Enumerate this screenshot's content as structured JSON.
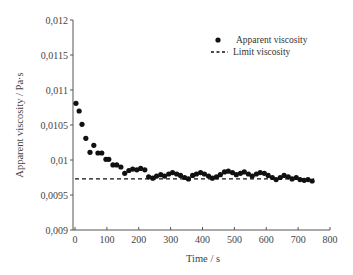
{
  "chart_data": {
    "type": "scatter",
    "title": "",
    "xlabel": "Time / s",
    "ylabel": "Apparent viscosity / Pa·s",
    "xlim": [
      0,
      800
    ],
    "ylim": [
      0.009,
      0.012
    ],
    "xticks": [
      0,
      100,
      200,
      300,
      400,
      500,
      600,
      700,
      800
    ],
    "xtick_labels": [
      "0",
      "100",
      "200",
      "300",
      "400",
      "500",
      "600",
      "700",
      "800"
    ],
    "yticks": [
      0.009,
      0.0095,
      0.01,
      0.0105,
      0.011,
      0.0115,
      0.012
    ],
    "ytick_labels": [
      "0,009",
      "0,0095",
      "0,01",
      "0,0105",
      "0,011",
      "0,0115",
      "0,012"
    ],
    "grid": false,
    "legend_position": "upper right",
    "series": [
      {
        "name": "Apparent viscosity",
        "style": "markers",
        "marker": "filled-circle",
        "color": "#111111",
        "x": [
          3,
          13,
          22,
          34,
          47,
          59,
          72,
          84,
          97,
          106,
          119,
          131,
          144,
          156,
          169,
          181,
          194,
          206,
          219,
          231,
          244,
          256,
          269,
          281,
          294,
          306,
          319,
          331,
          344,
          356,
          369,
          381,
          394,
          406,
          419,
          431,
          444,
          456,
          469,
          481,
          494,
          506,
          519,
          531,
          544,
          556,
          569,
          581,
          594,
          606,
          619,
          631,
          644,
          656,
          669,
          681,
          694,
          706,
          719,
          731,
          744
        ],
        "y": [
          0.01081,
          0.0107,
          0.01051,
          0.01031,
          0.01011,
          0.01021,
          0.0101,
          0.0101,
          0.01001,
          0.01001,
          0.00993,
          0.00993,
          0.0099,
          0.00981,
          0.00985,
          0.00987,
          0.00986,
          0.00988,
          0.00986,
          0.00976,
          0.00974,
          0.00977,
          0.00979,
          0.00977,
          0.0098,
          0.00982,
          0.0098,
          0.00978,
          0.00975,
          0.00973,
          0.00978,
          0.0098,
          0.00982,
          0.0098,
          0.00977,
          0.00974,
          0.00976,
          0.00979,
          0.00983,
          0.00984,
          0.00982,
          0.00979,
          0.00981,
          0.00983,
          0.0098,
          0.00977,
          0.0098,
          0.00982,
          0.00981,
          0.00978,
          0.00975,
          0.00972,
          0.00975,
          0.00978,
          0.00976,
          0.00973,
          0.00975,
          0.00972,
          0.00971,
          0.00972,
          0.0097
        ]
      },
      {
        "name": "Limit viscosity",
        "style": "dashed-line",
        "color": "#111111",
        "x": [
          0,
          750
        ],
        "y": [
          0.00973,
          0.00973
        ]
      }
    ]
  },
  "legend": {
    "items": [
      {
        "label": "Apparent viscosity",
        "symbol": "dot"
      },
      {
        "label": "Limit viscosity",
        "symbol": "dash"
      }
    ]
  },
  "axes": {
    "x_title": "Time / s",
    "y_title": "Apparent viscosity / Pa·s"
  }
}
